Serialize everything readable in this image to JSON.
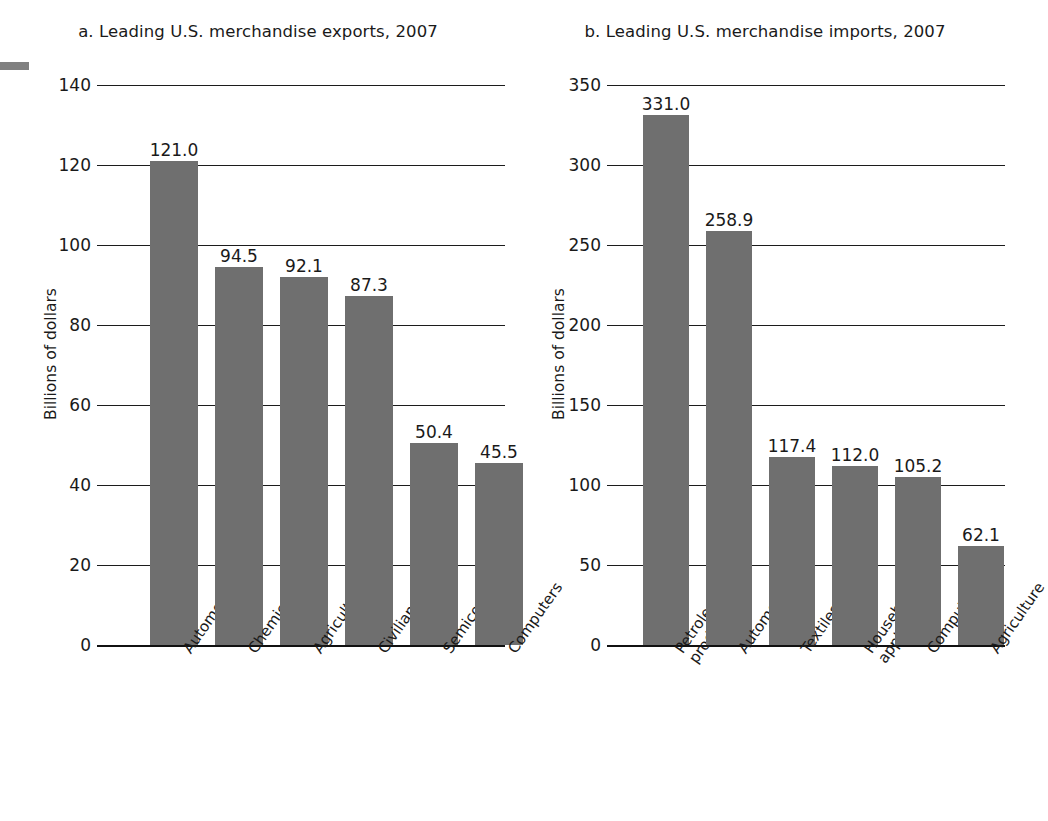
{
  "figure": {
    "margin_mark": "margin-rule"
  },
  "panels": [
    {
      "id": "a",
      "title": "a. Leading U.S. merchandise exports, 2007",
      "ylabel": "Billions of dollars"
    },
    {
      "id": "b",
      "title": "b. Leading U.S. merchandise imports, 2007",
      "ylabel": "Billions of dollars"
    }
  ],
  "chart_data": [
    {
      "type": "bar",
      "title": "a. Leading U.S. merchandise exports, 2007",
      "xlabel": "",
      "ylabel": "Billions of dollars",
      "ylim": [
        0,
        140
      ],
      "yticks": [
        0,
        20,
        40,
        60,
        80,
        100,
        120,
        140
      ],
      "ytick_labels": [
        "0",
        "20",
        "40",
        "60",
        "80",
        "100",
        "120",
        "140"
      ],
      "grid": true,
      "legend": false,
      "categories": [
        "Automobiles",
        "Chemicals",
        "Agriculture",
        "Civilian aircraft",
        "Semiconductors",
        "Computers"
      ],
      "values": [
        121.0,
        94.5,
        92.1,
        87.3,
        50.4,
        45.5
      ],
      "value_labels": [
        "121.0",
        "94.5",
        "92.1",
        "87.3",
        "50.4",
        "45.5"
      ],
      "bar_color": "#6f6f6f"
    },
    {
      "type": "bar",
      "title": "b. Leading U.S. merchandise imports, 2007",
      "xlabel": "",
      "ylabel": "Billions of dollars",
      "ylim": [
        0,
        350
      ],
      "yticks": [
        0,
        50,
        100,
        150,
        200,
        250,
        300,
        350
      ],
      "ytick_labels": [
        "0",
        "50",
        "100",
        "150",
        "200",
        "250",
        "300",
        "350"
      ],
      "grid": true,
      "legend": false,
      "categories": [
        "Petroleum\nproducts",
        "Automobiles",
        "Textiles",
        "Household\nappliances",
        "Computers",
        "Agriculture"
      ],
      "values": [
        331.0,
        258.9,
        117.4,
        112.0,
        105.2,
        62.1
      ],
      "value_labels": [
        "331.0",
        "258.9",
        "117.4",
        "112.0",
        "105.2",
        "62.1"
      ],
      "bar_color": "#6f6f6f"
    }
  ]
}
